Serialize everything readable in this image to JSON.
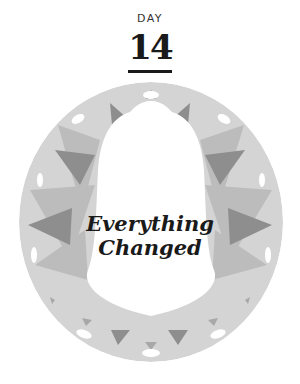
{
  "header": {
    "label": "DAY",
    "number": "14"
  },
  "title": {
    "line1": "Everything",
    "line2": "Changed"
  },
  "colors": {
    "ring": "#d2d2d2",
    "light": "#bdbdbd",
    "dark": "#8c8c8c",
    "text": "#1a1a1a"
  },
  "icons": {
    "emblem": "bell-in-ring-icon"
  }
}
